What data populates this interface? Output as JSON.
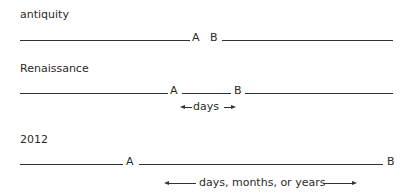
{
  "rows": [
    {
      "era": "antiquity",
      "point_a": "A",
      "point_b": "B"
    },
    {
      "era": "Renaissance",
      "point_a": "A",
      "point_b": "B",
      "interval_label": "days"
    },
    {
      "era": "2012",
      "point_a": "A",
      "point_b": "B",
      "interval_label": "days, months, or years"
    }
  ]
}
